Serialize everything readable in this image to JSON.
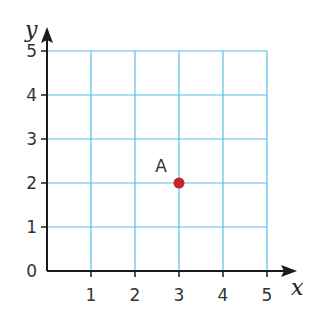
{
  "chart_data": {
    "type": "scatter",
    "title": "",
    "xlabel": "x",
    "ylabel": "y",
    "xlim": [
      0,
      5
    ],
    "ylim": [
      0,
      5
    ],
    "grid": true,
    "x_ticks": [
      "1",
      "2",
      "3",
      "4",
      "5"
    ],
    "y_ticks": [
      "1",
      "2",
      "3",
      "4",
      "5"
    ],
    "origin_label": "0",
    "points": [
      {
        "label": "A",
        "x": 3,
        "y": 2,
        "color": "#c0282d"
      }
    ]
  },
  "colors": {
    "grid": "#5bc0e8",
    "axis": "#1a1a1a",
    "point": "#c0282d"
  }
}
